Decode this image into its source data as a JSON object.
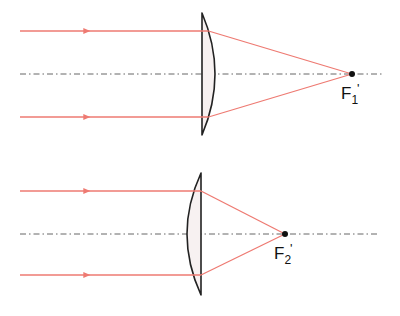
{
  "colors": {
    "ray": "#ee7a72",
    "lens_stroke": "#222222",
    "lens_fill": "#f7f1f1",
    "axis": "#666666",
    "focus": "#111111"
  },
  "diagrams": [
    {
      "name": "lens-1",
      "lens_type": "plano-convex, flat side facing incoming light",
      "axis_y": 74,
      "axis_x": [
        20,
        382
      ],
      "rays_y": [
        31,
        117
      ],
      "ray_start_x": 20,
      "arrow_x": 88,
      "lens_flat_x": 202,
      "lens_bulge_x": 215,
      "lens_top_y": 13,
      "lens_bottom_y": 135,
      "focus": {
        "x": 352,
        "y": 74,
        "label": "F",
        "subscript": "1",
        "prime": "'"
      }
    },
    {
      "name": "lens-2",
      "lens_type": "plano-convex, convex side facing incoming light",
      "axis_y": 234,
      "axis_x": [
        20,
        380
      ],
      "rays_y": [
        191,
        275
      ],
      "ray_start_x": 20,
      "arrow_x": 88,
      "lens_flat_x": 201,
      "lens_bulge_x": 187,
      "lens_top_y": 173,
      "lens_bottom_y": 295,
      "focus": {
        "x": 285,
        "y": 234,
        "label": "F",
        "subscript": "2",
        "prime": "'"
      }
    }
  ]
}
